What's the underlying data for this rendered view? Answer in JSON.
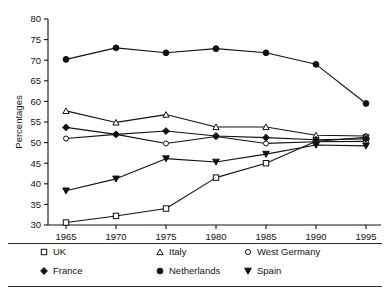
{
  "chart_data": {
    "type": "line",
    "title": "",
    "subtitle": "",
    "xlabel": "",
    "ylabel": "Percentages",
    "x": [
      1965,
      1970,
      1975,
      1980,
      1985,
      1990,
      1995
    ],
    "xticklabels": [
      "1965",
      "1970",
      "1975",
      "1980",
      "1985",
      "1990",
      "1995"
    ],
    "yticklabels": [
      "30",
      "35",
      "40",
      "45",
      "50",
      "55",
      "60",
      "65",
      "70",
      "75",
      "80"
    ],
    "yticks": [
      30,
      35,
      40,
      45,
      50,
      55,
      60,
      65,
      70,
      75,
      80
    ],
    "xlim": [
      1963.2,
      1996.5
    ],
    "ylim": [
      30,
      80
    ],
    "grid": false,
    "legend_position": "below-axes",
    "series": [
      {
        "name": "UK",
        "marker": "open-square",
        "values": [
          30.6,
          32.2,
          34.0,
          41.5,
          45.0,
          50.3,
          51.3
        ]
      },
      {
        "name": "Italy",
        "marker": "open-triangle-up",
        "values": [
          57.7,
          54.9,
          56.8,
          53.8,
          53.8,
          51.8,
          51.6
        ]
      },
      {
        "name": "West Germany",
        "marker": "open-circle",
        "values": [
          51.0,
          52.0,
          49.8,
          51.5,
          49.8,
          50.2,
          50.3
        ]
      },
      {
        "name": "France",
        "marker": "filled-diamond",
        "values": [
          53.7,
          52.0,
          52.8,
          51.6,
          51.2,
          50.7,
          50.9
        ]
      },
      {
        "name": "Netherlands",
        "marker": "filled-circle",
        "values": [
          70.2,
          73.0,
          71.8,
          72.8,
          71.8,
          69.0,
          59.5
        ]
      },
      {
        "name": "Spain",
        "marker": "filled-triangle-down",
        "values": [
          38.3,
          41.2,
          46.1,
          45.3,
          47.2,
          49.4,
          49.2
        ]
      }
    ],
    "legend": [
      {
        "label": "UK",
        "marker": "open-square"
      },
      {
        "label": "Italy",
        "marker": "open-triangle-up"
      },
      {
        "label": "West Germany",
        "marker": "open-circle"
      },
      {
        "label": "France",
        "marker": "filled-diamond"
      },
      {
        "label": "Netherlands",
        "marker": "filled-circle"
      },
      {
        "label": "Spain",
        "marker": "filled-triangle-down"
      }
    ],
    "colors": {
      "ink": "#111111",
      "background": "#ffffff",
      "marker_fill_open": "#ffffff"
    }
  }
}
